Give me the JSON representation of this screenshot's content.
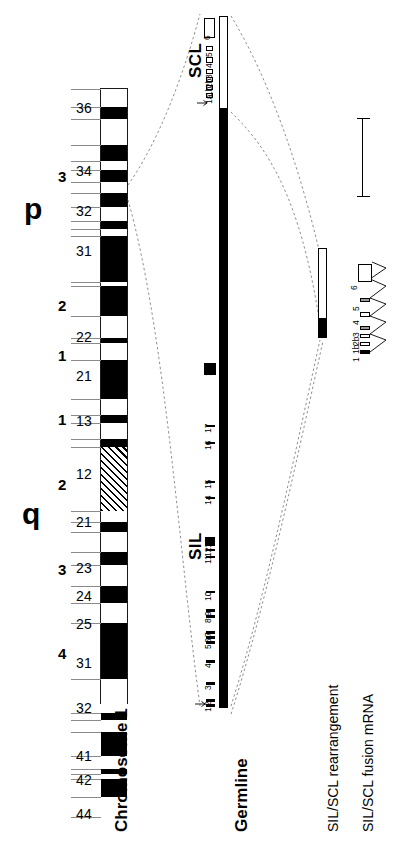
{
  "figure": {
    "orientation": "rotated-90-ccw",
    "scale_bar": {
      "label": "10 kb",
      "length_kb": 10
    }
  },
  "ideogram": {
    "title": "Chromosome 1",
    "arms": [
      {
        "name": "p",
        "label": "p"
      },
      {
        "name": "q",
        "label": "q"
      }
    ],
    "region_numbers_p": [
      "3",
      "2",
      "1"
    ],
    "region_numbers_q": [
      "1",
      "2",
      "3",
      "4"
    ],
    "band_labels_p": [
      "36",
      "34",
      "32",
      "31",
      "22",
      "21",
      "13"
    ],
    "band_labels_q": [
      "12",
      "21",
      "23",
      "24",
      "25",
      "31",
      "32",
      "41",
      "42",
      "44"
    ],
    "bands": [
      {
        "id": "p36",
        "label": "36",
        "stain": "light",
        "top": 0,
        "height": 18
      },
      {
        "id": "p36b",
        "label": "",
        "stain": "dark",
        "top": 18,
        "height": 12
      },
      {
        "id": "p36c",
        "label": "",
        "stain": "light",
        "top": 30,
        "height": 26
      },
      {
        "id": "p35",
        "label": "",
        "stain": "dark",
        "top": 56,
        "height": 16
      },
      {
        "id": "p34a",
        "label": "",
        "stain": "light",
        "top": 72,
        "height": 9
      },
      {
        "id": "p34",
        "label": "34",
        "stain": "dark",
        "top": 81,
        "height": 12
      },
      {
        "id": "p33a",
        "label": "",
        "stain": "light",
        "top": 93,
        "height": 11
      },
      {
        "id": "p33",
        "label": "",
        "stain": "dark",
        "top": 104,
        "height": 14
      },
      {
        "id": "p32a",
        "label": "32",
        "stain": "light",
        "top": 118,
        "height": 14
      },
      {
        "id": "p32b",
        "label": "",
        "stain": "dark",
        "top": 132,
        "height": 8
      },
      {
        "id": "p32c",
        "label": "",
        "stain": "light",
        "top": 140,
        "height": 7
      },
      {
        "id": "p31",
        "label": "31",
        "stain": "dark",
        "top": 147,
        "height": 46
      },
      {
        "id": "p31b",
        "label": "",
        "stain": "light",
        "top": 193,
        "height": 4
      },
      {
        "id": "p31c",
        "label": "",
        "stain": "dark",
        "top": 197,
        "height": 30
      },
      {
        "id": "p22a",
        "label": "",
        "stain": "light",
        "top": 227,
        "height": 22
      },
      {
        "id": "p22",
        "label": "22",
        "stain": "dark",
        "top": 249,
        "height": 5
      },
      {
        "id": "p22b",
        "label": "",
        "stain": "light",
        "top": 254,
        "height": 17
      },
      {
        "id": "p21",
        "label": "21",
        "stain": "dark",
        "top": 271,
        "height": 39
      },
      {
        "id": "p13a",
        "label": "",
        "stain": "light",
        "top": 310,
        "height": 16
      },
      {
        "id": "p13",
        "label": "13",
        "stain": "dark",
        "top": 326,
        "height": 8
      },
      {
        "id": "p12",
        "label": "",
        "stain": "light",
        "top": 334,
        "height": 16
      },
      {
        "id": "p11",
        "label": "",
        "stain": "dark",
        "top": 350,
        "height": 8
      },
      {
        "id": "cen",
        "label": "",
        "stain": "cen",
        "top": 358,
        "height": 64
      },
      {
        "id": "q21a",
        "label": "",
        "stain": "light",
        "top": 422,
        "height": 11
      },
      {
        "id": "q21",
        "label": "21",
        "stain": "dark",
        "top": 433,
        "height": 10
      },
      {
        "id": "q21b",
        "label": "",
        "stain": "light",
        "top": 443,
        "height": 20
      },
      {
        "id": "q22",
        "label": "",
        "stain": "dark",
        "top": 463,
        "height": 13
      },
      {
        "id": "q23",
        "label": "23",
        "stain": "light",
        "top": 476,
        "height": 21
      },
      {
        "id": "q24",
        "label": "24",
        "stain": "dark",
        "top": 497,
        "height": 17
      },
      {
        "id": "q25",
        "label": "25",
        "stain": "light",
        "top": 514,
        "height": 20
      },
      {
        "id": "q31",
        "label": "31",
        "stain": "dark",
        "top": 534,
        "height": 56
      },
      {
        "id": "q32",
        "label": "32",
        "stain": "light",
        "top": 590,
        "height": 34
      },
      {
        "id": "q32b",
        "label": "",
        "stain": "dark",
        "top": 624,
        "height": 7
      },
      {
        "id": "q32c",
        "label": "",
        "stain": "light",
        "top": 631,
        "height": 12
      },
      {
        "id": "q41",
        "label": "41",
        "stain": "dark",
        "top": 643,
        "height": 24
      },
      {
        "id": "q42",
        "label": "42",
        "stain": "light",
        "top": 667,
        "height": 13
      },
      {
        "id": "q42b",
        "label": "",
        "stain": "dark",
        "top": 680,
        "height": 5
      },
      {
        "id": "q43",
        "label": "",
        "stain": "light",
        "top": 685,
        "height": 5
      },
      {
        "id": "q44a",
        "label": "",
        "stain": "dark",
        "top": 690,
        "height": 18
      },
      {
        "id": "q44",
        "label": "44",
        "stain": "light",
        "top": 708,
        "height": 20
      }
    ]
  },
  "genes": {
    "scl": {
      "name": "SCL",
      "exons": [
        "1a",
        "1b",
        "2b",
        "3",
        "4",
        "5",
        "6"
      ],
      "transcription_start_marker": "arrow"
    },
    "sil": {
      "name": "SIL",
      "exons": [
        "1",
        "2",
        "3",
        "4",
        "5",
        "6",
        "7",
        "8",
        "9",
        "10",
        "11",
        "12",
        "13",
        "14",
        "15",
        "16",
        "17",
        "18"
      ],
      "transcription_start_marker": "arrow"
    }
  },
  "tracks": {
    "germline": {
      "label": "Germline"
    },
    "rearrangement": {
      "label": "SIL/SCL rearrangement"
    },
    "fusion_mrna": {
      "label": "SIL/SCL fusion mRNA",
      "exons": [
        "1",
        "1b",
        "2b",
        "3",
        "4",
        "5",
        "6"
      ]
    }
  }
}
